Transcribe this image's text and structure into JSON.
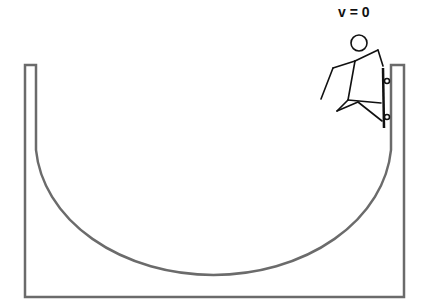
{
  "diagram": {
    "velocity_label": "v = 0",
    "colors": {
      "ramp": "#6b6b6b",
      "figure": "#111111",
      "background": "#ffffff"
    }
  }
}
